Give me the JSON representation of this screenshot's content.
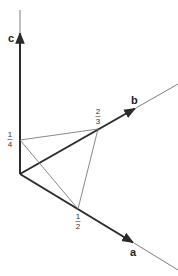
{
  "diagram": {
    "type": "crystallographic-axes-plane-intercepts",
    "axes": [
      {
        "name": "a",
        "label": "a",
        "intercept": {
          "num": "1",
          "den": "2"
        }
      },
      {
        "name": "b",
        "label": "b",
        "intercept": {
          "num": "2",
          "den": "3"
        }
      },
      {
        "name": "c",
        "label": "c",
        "intercept": {
          "num": "1",
          "den": "4"
        }
      }
    ],
    "colors": {
      "axis": "#2a2a2a",
      "plane": "#6a6a6a",
      "background": "#ffffff"
    }
  }
}
